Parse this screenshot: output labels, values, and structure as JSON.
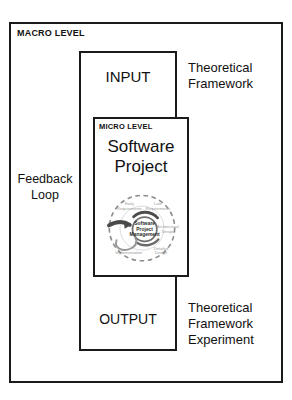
{
  "page": {
    "scan_sliver_text": "·  ·        ·                ·              ·             ·"
  },
  "diagram": {
    "type": "nested-box-flow",
    "macro": {
      "label": "MACRO LEVEL",
      "feedback_label": "Feedback\nLoop",
      "theoretical_framework_label": "Theoretical\nFramework",
      "theoretical_framework_experiment_label": "Theoretical\nFramework\nExperiment"
    },
    "io_column": {
      "input_label": "INPUT",
      "output_label": "OUTPUT"
    },
    "micro": {
      "label": "MICRO LEVEL",
      "title": "Software\nProject"
    },
    "cycle": {
      "hub": "Software\nProject\nManagement",
      "nodes": [
        {
          "label": "Early\nRequirements"
        },
        {
          "label": "Late\nRequirements"
        },
        {
          "label": "Architectural\nDesign"
        },
        {
          "label": "Detailed\nDesign"
        },
        {
          "label": "Implementation"
        }
      ]
    },
    "colors": {
      "stroke": "#1a1a1a",
      "background": "#ffffff",
      "cycle_dashed": "#8c8c8c",
      "cycle_arrow": "#5a5a5a"
    }
  }
}
